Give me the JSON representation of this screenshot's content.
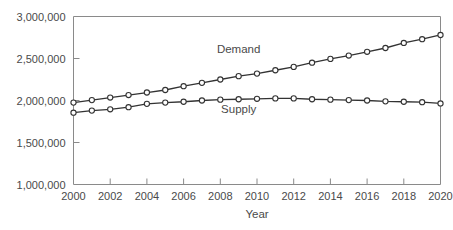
{
  "chart_data": {
    "type": "line",
    "title": "",
    "xlabel": "Year",
    "ylabel": "",
    "xlim": [
      2000,
      2020
    ],
    "ylim": [
      1000000,
      3000000
    ],
    "grid": false,
    "legend_position": "inline-annotation",
    "x": [
      2000,
      2001,
      2002,
      2003,
      2004,
      2005,
      2006,
      2007,
      2008,
      2009,
      2010,
      2011,
      2012,
      2013,
      2014,
      2015,
      2016,
      2017,
      2018,
      2019,
      2020
    ],
    "xtick_labels": [
      "2000",
      "2002",
      "2004",
      "2006",
      "2008",
      "2010",
      "2012",
      "2014",
      "2016",
      "2018",
      "2020"
    ],
    "xtick_values": [
      2000,
      2002,
      2004,
      2006,
      2008,
      2010,
      2012,
      2014,
      2016,
      2018,
      2020
    ],
    "ytick_labels": [
      "1,000,000",
      "1,500,000",
      "2,000,000",
      "2,500,000",
      "3,000,000"
    ],
    "ytick_values": [
      1000000,
      1500000,
      2000000,
      2500000,
      3000000
    ],
    "series": [
      {
        "name": "Demand",
        "label_x": 2009,
        "label_y": 2560000,
        "values": [
          1975000,
          2005000,
          2035000,
          2065000,
          2095000,
          2125000,
          2170000,
          2210000,
          2250000,
          2290000,
          2320000,
          2360000,
          2400000,
          2450000,
          2495000,
          2535000,
          2580000,
          2625000,
          2685000,
          2730000,
          2780000
        ]
      },
      {
        "name": "Supply",
        "label_x": 2009,
        "label_y": 1855000,
        "values": [
          1855000,
          1880000,
          1895000,
          1920000,
          1960000,
          1975000,
          1985000,
          2000000,
          2010000,
          2015000,
          2020000,
          2025000,
          2025000,
          2015000,
          2010000,
          2005000,
          2000000,
          1990000,
          1985000,
          1980000,
          1965000
        ]
      }
    ]
  }
}
